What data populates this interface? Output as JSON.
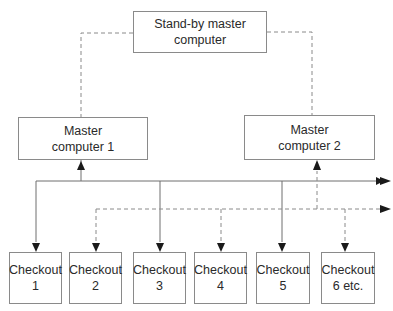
{
  "diagram": {
    "standby": {
      "label": "Stand-by master\ncomputer"
    },
    "master1": {
      "label": "Master\ncomputer 1"
    },
    "master2": {
      "label": "Master\ncomputer 2"
    },
    "checkouts": [
      {
        "label": "Checkout\n1",
        "link": "solid"
      },
      {
        "label": "Checkout\n2",
        "link": "dashed"
      },
      {
        "label": "Checkout\n3",
        "link": "solid"
      },
      {
        "label": "Checkout\n4",
        "link": "dashed"
      },
      {
        "label": "Checkout\n5",
        "link": "solid"
      },
      {
        "label": "Checkout\n6 etc.",
        "link": "dashed"
      }
    ],
    "edges": [
      {
        "from": "standby",
        "to": "master1",
        "style": "dashed"
      },
      {
        "from": "standby",
        "to": "master2",
        "style": "dashed"
      },
      {
        "from": "solid-bus",
        "to": "master1",
        "style": "solid"
      },
      {
        "from": "dashed-bus",
        "to": "master2",
        "style": "dashed"
      },
      {
        "from": "solid-bus",
        "to": "checkout-1",
        "style": "solid"
      },
      {
        "from": "dashed-bus",
        "to": "checkout-2",
        "style": "dashed"
      },
      {
        "from": "solid-bus",
        "to": "checkout-3",
        "style": "solid"
      },
      {
        "from": "dashed-bus",
        "to": "checkout-4",
        "style": "dashed"
      },
      {
        "from": "solid-bus",
        "to": "checkout-5",
        "style": "solid"
      },
      {
        "from": "dashed-bus",
        "to": "checkout-6",
        "style": "dashed"
      }
    ],
    "colors": {
      "line": "#6e6e6e",
      "dashed": "#8a8a8a",
      "text": "#2a2a2a"
    }
  }
}
